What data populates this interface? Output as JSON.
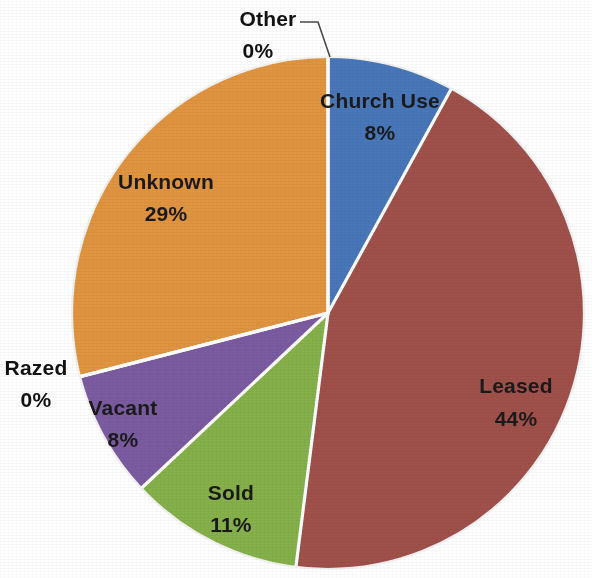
{
  "chart_data": {
    "type": "pie",
    "title": "",
    "subtitle": "",
    "xlabel": "",
    "ylabel": "",
    "legend_position": "none",
    "grid": false,
    "value_unit": "percent",
    "labels": [
      "Church Use",
      "Leased",
      "Sold",
      "Vacant",
      "Razed",
      "Unknown",
      "Other"
    ],
    "values": [
      8,
      44,
      11,
      8,
      0,
      29,
      0
    ],
    "colors": [
      "#4876b8",
      "#a0504a",
      "#85b04a",
      "#7b5ba0",
      "#e09440",
      "#e09440",
      "#4876b8"
    ],
    "start_angle_deg": 0,
    "direction": "clockwise",
    "slices": [
      {
        "name": "church-use",
        "label": "Church Use",
        "value_label": "8%",
        "value": 8,
        "color": "#4876b8",
        "label_placement": "inside",
        "label_x": 380,
        "label_y": 108,
        "value_x": 380,
        "value_y": 140
      },
      {
        "name": "leased",
        "label": "Leased",
        "value_label": "44%",
        "value": 44,
        "color": "#a0504a",
        "label_placement": "inside",
        "label_x": 516,
        "label_y": 393,
        "value_x": 516,
        "value_y": 426
      },
      {
        "name": "sold",
        "label": "Sold",
        "value_label": "11%",
        "value": 11,
        "color": "#85b04a",
        "label_placement": "inside",
        "label_x": 231,
        "label_y": 500,
        "value_x": 231,
        "value_y": 532
      },
      {
        "name": "vacant",
        "label": "Vacant",
        "value_label": "8%",
        "value": 8,
        "color": "#7b5ba0",
        "label_placement": "inside",
        "label_x": 123,
        "label_y": 415,
        "value_x": 123,
        "value_y": 447
      },
      {
        "name": "razed",
        "label": "Razed",
        "value_label": "0%",
        "value": 0,
        "color": "#e09440",
        "label_placement": "outside-left",
        "label_x": 36,
        "label_y": 375,
        "value_x": 36,
        "value_y": 407
      },
      {
        "name": "unknown",
        "label": "Unknown",
        "value_label": "29%",
        "value": 29,
        "color": "#e09440",
        "label_placement": "inside",
        "label_x": 166,
        "label_y": 189,
        "value_x": 166,
        "value_y": 221
      },
      {
        "name": "other",
        "label": "Other",
        "value_label": "0%",
        "value": 0,
        "color": "#4876b8",
        "label_placement": "outside-top",
        "label_x": 268,
        "label_y": 26,
        "value_x": 258,
        "value_y": 58,
        "leader_points": "300,22 318,22 330,57"
      }
    ],
    "geometry": {
      "center_x": 328,
      "center_y": 313,
      "radius": 256
    }
  }
}
